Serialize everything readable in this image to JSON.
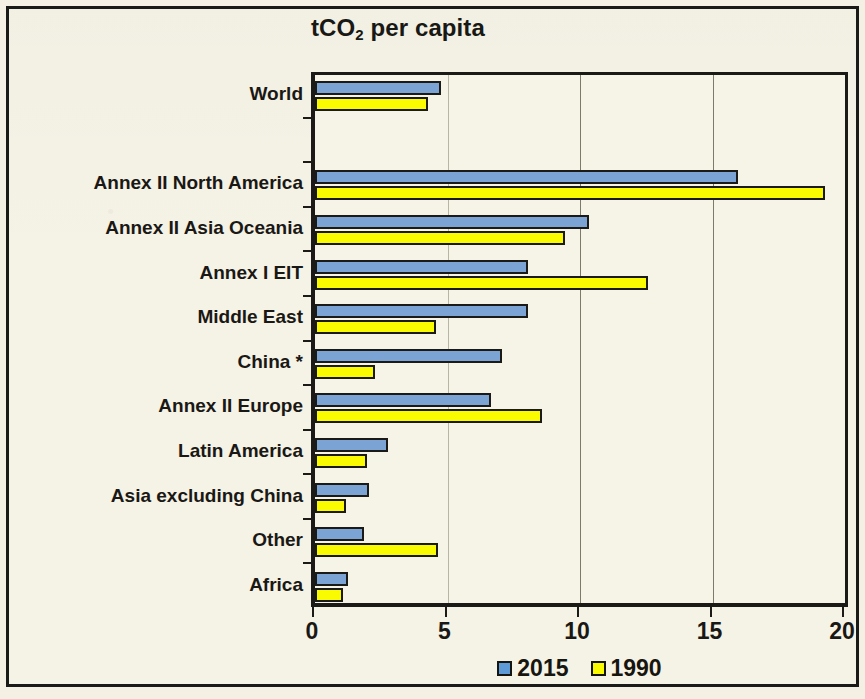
{
  "chart_data": {
    "type": "bar",
    "orientation": "horizontal",
    "title": "tCO2 per capita",
    "title_prefix": "tCO",
    "title_sub": "2",
    "title_suffix": " per capita",
    "xlabel": "",
    "ylabel": "",
    "xlim": [
      0,
      20
    ],
    "xticks": [
      0,
      5,
      10,
      15,
      20
    ],
    "xtick_labels": [
      "0",
      "5",
      "10",
      "15",
      "20"
    ],
    "grid": "vertical",
    "legend_position": "bottom-center",
    "categories": [
      "World",
      "Annex II North America",
      "Annex II Asia Oceania",
      "Annex I EIT",
      "Middle East",
      "China *",
      "Annex II Europe",
      "Latin America",
      "Asia excluding China",
      "Other",
      "Africa"
    ],
    "series": [
      {
        "name": "2015",
        "color": "#7ba3d4",
        "values": [
          4.6,
          15.8,
          10.2,
          7.9,
          7.9,
          6.9,
          6.5,
          2.6,
          1.9,
          1.7,
          1.1
        ]
      },
      {
        "name": "1990",
        "color": "#fafa00",
        "values": [
          4.1,
          19.1,
          9.3,
          12.4,
          4.4,
          2.1,
          8.4,
          1.8,
          1.0,
          4.5,
          0.9
        ]
      }
    ],
    "row_slots": [
      0,
      2,
      3,
      4,
      5,
      6,
      7,
      8,
      9,
      10,
      11
    ],
    "slot_count": 12
  },
  "legend": {
    "items": [
      {
        "label": "2015",
        "color": "#7ba3d4"
      },
      {
        "label": "1990",
        "color": "#fafa00"
      }
    ]
  },
  "colors": {
    "series_2015": "#7ba3d4",
    "series_1990": "#fafa00",
    "outline": "#1c1a16",
    "background": "#f5f2e6",
    "gridline": "#7d7a6c"
  }
}
